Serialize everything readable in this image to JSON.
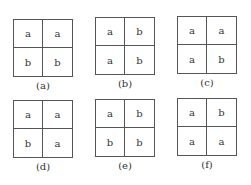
{
  "panels": [
    {
      "label": "(a)",
      "cells": [
        "a",
        "a",
        "b",
        "b"
      ],
      "x": 13,
      "y": 19
    },
    {
      "label": "(b)",
      "cells": [
        "a",
        "b",
        "a",
        "b"
      ],
      "x": 95,
      "y": 17
    },
    {
      "label": "(c)",
      "cells": [
        "a",
        "a",
        "a",
        "b"
      ],
      "x": 177,
      "y": 16
    },
    {
      "label": "(d)",
      "cells": [
        "a",
        "a",
        "b",
        "a"
      ],
      "x": 13,
      "y": 100
    },
    {
      "label": "(e)",
      "cells": [
        "a",
        "b",
        "b",
        "b"
      ],
      "x": 95,
      "y": 99
    },
    {
      "label": "(f)",
      "cells": [
        "a",
        "b",
        "a",
        "a"
      ],
      "x": 177,
      "y": 98
    }
  ]
}
